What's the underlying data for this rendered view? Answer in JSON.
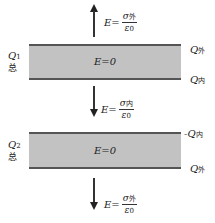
{
  "diagram": {
    "top_field": {
      "direction": "up",
      "lhs": "E=",
      "numerator_symbol": "σ",
      "numerator_sub": "外",
      "denominator_symbol": "ε",
      "denominator_sub": "0"
    },
    "plate1": {
      "inner_label": "E=0",
      "left_label": "Q",
      "left_sub": "1",
      "left_zh": "总",
      "right_top_label": "Q",
      "right_top_sub": "外",
      "right_bottom_label": "Q",
      "right_bottom_sub": "内"
    },
    "middle_field": {
      "direction": "down",
      "lhs": "E=",
      "numerator_symbol": "σ",
      "numerator_sub": "内",
      "denominator_symbol": "ε",
      "denominator_sub": "0"
    },
    "plate2": {
      "inner_label": "E=0",
      "left_label": "Q",
      "left_sub": "2",
      "left_zh": "总",
      "right_top_label": "-Q",
      "right_top_sub": "内",
      "right_bottom_label": "Q",
      "right_bottom_sub": "外"
    },
    "bottom_field": {
      "direction": "down",
      "lhs": "E=",
      "numerator_symbol": "σ",
      "numerator_sub": "外",
      "denominator_symbol": "ε",
      "denominator_sub": "0"
    },
    "colors": {
      "plate_fill": "#c2c2c2",
      "plate_edge": "#555555",
      "arrow": "#222222"
    }
  }
}
